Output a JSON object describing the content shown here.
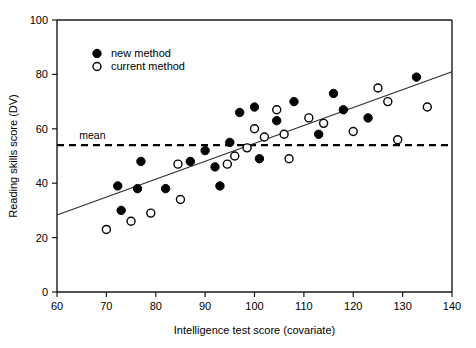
{
  "chart_data": {
    "type": "scatter",
    "title": "",
    "xlabel": "Intelligence test score (covariate)",
    "ylabel": "Reading skills score (DV)",
    "xlim": [
      60,
      140
    ],
    "ylim": [
      0,
      100
    ],
    "xticks": [
      60,
      70,
      80,
      90,
      100,
      110,
      120,
      130,
      140
    ],
    "yticks": [
      0,
      20,
      40,
      60,
      80,
      100
    ],
    "grid": false,
    "legend_position": "top-left",
    "legend": [
      {
        "key": "new",
        "label": "new method",
        "marker": "filled-circle"
      },
      {
        "key": "current",
        "label": "current method",
        "marker": "open-circle"
      }
    ],
    "annotations": [
      {
        "name": "mean-line-label",
        "text": "mean",
        "value": 54
      }
    ],
    "reference_lines": [
      {
        "name": "mean",
        "orientation": "horizontal",
        "y": 54,
        "style": "dashed"
      }
    ],
    "trend_line": {
      "name": "regression-line",
      "style": "solid",
      "x_start": 60,
      "y_start": 28.3,
      "x_end": 140,
      "y_end": 81.0
    },
    "series": [
      {
        "name": "new method",
        "marker": "filled-circle",
        "points": [
          [
            72.3,
            39
          ],
          [
            73.0,
            30
          ],
          [
            76.3,
            38
          ],
          [
            77.0,
            48
          ],
          [
            82.0,
            38
          ],
          [
            87.0,
            48
          ],
          [
            90.0,
            52
          ],
          [
            92.0,
            46
          ],
          [
            93.0,
            39
          ],
          [
            95.0,
            55
          ],
          [
            97.0,
            66
          ],
          [
            100.0,
            68
          ],
          [
            101.0,
            49
          ],
          [
            104.5,
            63
          ],
          [
            108.0,
            70
          ],
          [
            113.0,
            58
          ],
          [
            116.0,
            73
          ],
          [
            118.0,
            67
          ],
          [
            123.0,
            64
          ],
          [
            132.8,
            79
          ]
        ]
      },
      {
        "name": "current method",
        "marker": "open-circle",
        "points": [
          [
            70.0,
            23
          ],
          [
            75.0,
            26
          ],
          [
            79.0,
            29
          ],
          [
            84.5,
            47
          ],
          [
            85.0,
            34
          ],
          [
            94.5,
            47
          ],
          [
            96.0,
            50
          ],
          [
            98.5,
            53
          ],
          [
            100.0,
            60
          ],
          [
            102.0,
            57
          ],
          [
            104.5,
            67
          ],
          [
            106.0,
            58
          ],
          [
            107.0,
            49
          ],
          [
            111.0,
            64
          ],
          [
            114.0,
            62
          ],
          [
            120.0,
            59
          ],
          [
            125.0,
            75
          ],
          [
            127.0,
            70
          ],
          [
            129.0,
            56
          ],
          [
            135.0,
            68
          ]
        ]
      }
    ]
  },
  "axes": {
    "x_tick_labels": [
      "60",
      "70",
      "80",
      "90",
      "100",
      "110",
      "120",
      "130",
      "140"
    ],
    "y_tick_labels": [
      "0",
      "20",
      "40",
      "60",
      "80",
      "100"
    ],
    "x_title": "Intelligence test score (covariate)",
    "y_title": "Reading skills score (DV)"
  },
  "legend": {
    "new_label": "new method",
    "current_label": "current method"
  },
  "mean": {
    "label": "mean"
  }
}
